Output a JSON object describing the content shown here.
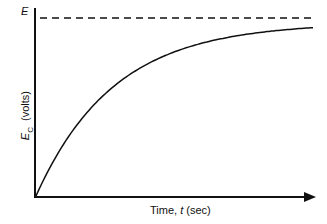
{
  "chart_data": {
    "type": "line",
    "title": "",
    "xlabel": "Time, t (sec)",
    "ylabel": "E_C (volts)",
    "asymptote_label": "E",
    "grid": false,
    "legend": null,
    "series": [
      {
        "name": "E_C = E(1 - e^(-t/RC))",
        "x": [
          0,
          0.5,
          1,
          1.5,
          2,
          2.5,
          3,
          3.5,
          4
        ],
        "values": [
          0,
          0.48,
          0.68,
          0.8,
          0.87,
          0.91,
          0.94,
          0.96,
          0.97
        ]
      }
    ],
    "asymptote": {
      "value": 1,
      "style": "dashed",
      "label": "E"
    },
    "xlim": [
      0,
      4
    ],
    "ylim": [
      0,
      1.05
    ]
  },
  "labels": {
    "asymptote": "E",
    "x_prefix": "Time, ",
    "x_var": "t",
    "x_unit": " (sec)",
    "y_var": "E",
    "y_sub": "C",
    "y_unit": "(volts)"
  }
}
